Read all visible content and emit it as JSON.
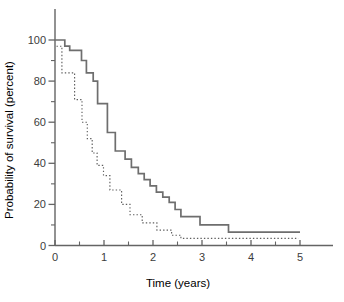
{
  "figure": {
    "background_color": "#ffffff",
    "axis_color": "#646464",
    "text_color": "#3c3c3c",
    "solid_curve_color": "#6e6e6e",
    "dotted_curve_color": "#5f5f5f"
  },
  "chart_data": {
    "type": "line",
    "subtype": "kaplan-meier-step-survival",
    "title": "",
    "xlabel": "Time (years)",
    "ylabel": "Probability of survival (percent)",
    "xlim": [
      0,
      5
    ],
    "ylim": [
      0,
      100
    ],
    "grid": "off",
    "legend": "none",
    "x_ticks_major": [
      0,
      1,
      2,
      3,
      4,
      5
    ],
    "x_ticks_minor": [
      0.5,
      1.5,
      2.5,
      3.5,
      4.5
    ],
    "y_ticks_major": [
      0,
      20,
      40,
      60,
      80,
      100
    ],
    "y_ticks_minor": [
      10,
      30,
      50,
      70,
      90
    ],
    "series": [
      {
        "name": "solid curve",
        "line_style": "solid",
        "end_time": 5.0,
        "steps": [
          [
            0.0,
            100
          ],
          [
            0.2,
            97
          ],
          [
            0.3,
            95
          ],
          [
            0.54,
            90
          ],
          [
            0.64,
            84
          ],
          [
            0.78,
            80
          ],
          [
            0.87,
            69
          ],
          [
            1.07,
            55
          ],
          [
            1.23,
            46
          ],
          [
            1.43,
            42
          ],
          [
            1.56,
            38
          ],
          [
            1.7,
            35
          ],
          [
            1.82,
            32
          ],
          [
            1.94,
            29
          ],
          [
            2.07,
            26
          ],
          [
            2.2,
            23.5
          ],
          [
            2.33,
            21
          ],
          [
            2.45,
            17.5
          ],
          [
            2.57,
            14
          ],
          [
            2.96,
            10
          ],
          [
            3.54,
            6.5
          ]
        ]
      },
      {
        "name": "dotted curve",
        "line_style": "dotted",
        "end_time": 4.97,
        "steps": [
          [
            0.03,
            97
          ],
          [
            0.14,
            84
          ],
          [
            0.4,
            71
          ],
          [
            0.55,
            60
          ],
          [
            0.66,
            52
          ],
          [
            0.76,
            45
          ],
          [
            0.86,
            39
          ],
          [
            0.99,
            34
          ],
          [
            1.12,
            27
          ],
          [
            1.36,
            20
          ],
          [
            1.53,
            15
          ],
          [
            1.78,
            11
          ],
          [
            2.08,
            7.5
          ],
          [
            2.38,
            5
          ],
          [
            2.57,
            3.5
          ]
        ]
      }
    ]
  }
}
